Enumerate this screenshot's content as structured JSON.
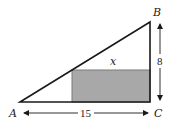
{
  "diagram": {
    "type": "geometry",
    "vertices": {
      "A": {
        "label": "A",
        "x": 20,
        "y": 102
      },
      "B": {
        "label": "B",
        "x": 150,
        "y": 22
      },
      "C": {
        "label": "C",
        "x": 150,
        "y": 102
      }
    },
    "rectangle": {
      "x": 72,
      "y": 70,
      "width": 78,
      "height": 32,
      "fill": "#a8a8a8",
      "stroke": "#6e6e6e"
    },
    "labels": {
      "A": "A",
      "B": "B",
      "C": "C",
      "x": "x",
      "height": "8",
      "base": "15"
    },
    "colors": {
      "stroke": "#1a1a1a",
      "shade": "#a8a8a8",
      "background": "#ffffff"
    }
  }
}
